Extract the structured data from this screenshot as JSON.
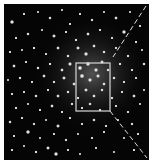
{
  "image": {
    "subject": "globular star cluster",
    "background": "#050505",
    "frame": {
      "x": 4,
      "y": 4,
      "width": 145,
      "height": 156
    },
    "glow_center": {
      "cx": 88,
      "cy": 70,
      "r": 60
    },
    "overlay": {
      "rectangle": {
        "x": 72,
        "y": 59,
        "width": 34,
        "height": 48,
        "stroke": "#d8d8d8"
      },
      "dashed_line_upper": {
        "x1": 142,
        "y1": 2,
        "x2": 109,
        "y2": 53
      },
      "dashed_line_lower": {
        "x1": 106,
        "y1": 107,
        "x2": 143,
        "y2": 154
      },
      "line_color": "#e0e0e0"
    },
    "stars": [
      [
        8,
        18,
        1.8
      ],
      [
        20,
        10,
        1.2
      ],
      [
        34,
        8,
        1.0
      ],
      [
        46,
        14,
        1.4
      ],
      [
        58,
        6,
        1.0
      ],
      [
        66,
        20,
        1.2
      ],
      [
        76,
        10,
        1.1
      ],
      [
        88,
        16,
        1.3
      ],
      [
        100,
        8,
        1.0
      ],
      [
        112,
        14,
        1.5
      ],
      [
        126,
        8,
        1.0
      ],
      [
        136,
        22,
        1.2
      ],
      [
        12,
        34,
        1.1
      ],
      [
        24,
        30,
        1.4
      ],
      [
        38,
        26,
        1.0
      ],
      [
        50,
        32,
        1.6
      ],
      [
        62,
        28,
        1.2
      ],
      [
        72,
        36,
        1.3
      ],
      [
        84,
        30,
        1.5
      ],
      [
        96,
        26,
        1.2
      ],
      [
        108,
        34,
        1.1
      ],
      [
        120,
        28,
        1.8
      ],
      [
        132,
        38,
        1.2
      ],
      [
        6,
        48,
        1.2
      ],
      [
        18,
        46,
        1.0
      ],
      [
        30,
        44,
        1.3
      ],
      [
        42,
        50,
        1.2
      ],
      [
        54,
        44,
        1.5
      ],
      [
        64,
        52,
        1.4
      ],
      [
        74,
        44,
        1.6
      ],
      [
        82,
        50,
        1.8
      ],
      [
        90,
        42,
        1.5
      ],
      [
        100,
        48,
        1.4
      ],
      [
        112,
        44,
        1.2
      ],
      [
        124,
        52,
        1.3
      ],
      [
        138,
        46,
        1.0
      ],
      [
        10,
        62,
        1.5
      ],
      [
        22,
        58,
        1.1
      ],
      [
        34,
        64,
        1.4
      ],
      [
        46,
        60,
        1.3
      ],
      [
        58,
        66,
        1.5
      ],
      [
        66,
        60,
        1.7
      ],
      [
        76,
        64,
        2.0
      ],
      [
        84,
        60,
        1.9
      ],
      [
        92,
        66,
        1.8
      ],
      [
        98,
        58,
        1.6
      ],
      [
        104,
        66,
        1.4
      ],
      [
        116,
        60,
        1.3
      ],
      [
        128,
        66,
        1.2
      ],
      [
        140,
        60,
        1.4
      ],
      [
        4,
        76,
        1.0
      ],
      [
        16,
        74,
        1.3
      ],
      [
        28,
        78,
        1.1
      ],
      [
        40,
        72,
        1.5
      ],
      [
        50,
        78,
        1.3
      ],
      [
        60,
        74,
        1.6
      ],
      [
        70,
        80,
        1.5
      ],
      [
        78,
        72,
        2.0
      ],
      [
        86,
        76,
        1.8
      ],
      [
        94,
        72,
        1.7
      ],
      [
        100,
        80,
        1.5
      ],
      [
        110,
        74,
        1.4
      ],
      [
        120,
        78,
        1.2
      ],
      [
        132,
        74,
        1.1
      ],
      [
        8,
        90,
        1.2
      ],
      [
        20,
        88,
        1.1
      ],
      [
        32,
        92,
        1.4
      ],
      [
        44,
        86,
        1.2
      ],
      [
        54,
        92,
        1.5
      ],
      [
        64,
        88,
        1.4
      ],
      [
        74,
        94,
        1.3
      ],
      [
        82,
        86,
        1.6
      ],
      [
        90,
        92,
        1.5
      ],
      [
        98,
        86,
        1.4
      ],
      [
        108,
        94,
        1.3
      ],
      [
        118,
        88,
        1.2
      ],
      [
        130,
        92,
        1.5
      ],
      [
        140,
        86,
        1.0
      ],
      [
        12,
        104,
        1.3
      ],
      [
        24,
        100,
        1.0
      ],
      [
        36,
        106,
        1.2
      ],
      [
        48,
        102,
        1.5
      ],
      [
        58,
        108,
        1.2
      ],
      [
        68,
        100,
        1.3
      ],
      [
        78,
        104,
        1.2
      ],
      [
        86,
        100,
        1.4
      ],
      [
        96,
        106,
        1.3
      ],
      [
        112,
        102,
        1.1
      ],
      [
        124,
        108,
        1.2
      ],
      [
        136,
        100,
        1.0
      ],
      [
        6,
        118,
        1.4
      ],
      [
        18,
        114,
        1.1
      ],
      [
        30,
        120,
        1.3
      ],
      [
        42,
        116,
        1.0
      ],
      [
        54,
        122,
        1.6
      ],
      [
        66,
        114,
        1.2
      ],
      [
        78,
        120,
        1.1
      ],
      [
        90,
        116,
        1.4
      ],
      [
        102,
        122,
        1.2
      ],
      [
        114,
        116,
        1.0
      ],
      [
        128,
        120,
        1.3
      ],
      [
        10,
        132,
        1.1
      ],
      [
        24,
        128,
        1.8
      ],
      [
        36,
        134,
        1.0
      ],
      [
        50,
        130,
        1.2
      ],
      [
        62,
        136,
        1.3
      ],
      [
        74,
        130,
        1.0
      ],
      [
        88,
        134,
        1.2
      ],
      [
        100,
        128,
        1.1
      ],
      [
        120,
        134,
        1.0
      ],
      [
        134,
        130,
        1.2
      ],
      [
        8,
        146,
        1.2
      ],
      [
        20,
        142,
        1.0
      ],
      [
        32,
        148,
        1.3
      ],
      [
        44,
        144,
        1.6
      ],
      [
        52,
        150,
        1.8
      ],
      [
        64,
        146,
        1.2
      ],
      [
        76,
        150,
        1.0
      ],
      [
        92,
        144,
        1.1
      ],
      [
        110,
        148,
        1.0
      ],
      [
        130,
        146,
        1.2
      ]
    ]
  }
}
